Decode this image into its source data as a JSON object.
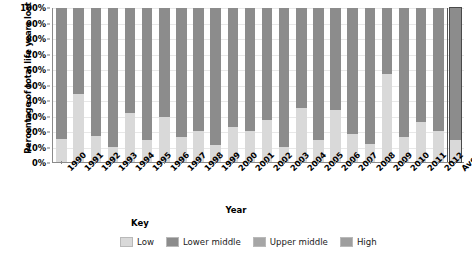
{
  "chart_data": {
    "type": "bar",
    "title": "",
    "subtitle": "",
    "xlabel": "Year",
    "ylabel": "Percentage of total life years lost",
    "stacked": true,
    "normalized_100_percent": true,
    "grid": true,
    "legend_position": "bottom",
    "legend_title": "Key",
    "ylim": [
      0,
      100
    ],
    "yticks": [
      "0%",
      "10%",
      "20%",
      "30%",
      "40%",
      "50%",
      "60%",
      "70%",
      "80%",
      "90%",
      "100%"
    ],
    "ytick_values": [
      0,
      10,
      20,
      30,
      40,
      50,
      60,
      70,
      80,
      90,
      100
    ],
    "categories": [
      "1990",
      "1991",
      "1992",
      "1993",
      "1994",
      "1995",
      "1996",
      "1997",
      "1998",
      "1999",
      "2000",
      "2001",
      "2002",
      "2003",
      "2004",
      "2005",
      "2006",
      "2007",
      "2008",
      "2009",
      "2010",
      "2011",
      "2012",
      "Average"
    ],
    "series": [
      {
        "name": "Low",
        "color": "#d9d9d9",
        "values": [
          15,
          44,
          17,
          10,
          32,
          14,
          29,
          16,
          20,
          11,
          23,
          20,
          27,
          10,
          35,
          14,
          34,
          18,
          12,
          57,
          16,
          26,
          20,
          14
        ]
      },
      {
        "name": "Lower middle",
        "color": "#8c8c8c",
        "values": [
          85,
          56,
          83,
          90,
          68,
          86,
          71,
          84,
          80,
          89,
          77,
          80,
          73,
          90,
          65,
          86,
          66,
          82,
          88,
          43,
          84,
          74,
          80,
          86
        ]
      },
      {
        "name": "Upper middle",
        "color": "#a6a6a6",
        "values": [
          0,
          0,
          0,
          0,
          0,
          0,
          0,
          0,
          0,
          0,
          0,
          0,
          0,
          0,
          0,
          0,
          0,
          0,
          0,
          0,
          0,
          0,
          0,
          0
        ]
      },
      {
        "name": "High",
        "color": "#999999",
        "values": [
          0,
          0,
          0,
          0,
          0,
          0,
          0,
          0,
          0,
          0,
          0,
          0,
          0,
          0,
          0,
          0,
          0,
          0,
          0,
          0,
          0,
          0,
          0,
          0
        ]
      }
    ],
    "average_bar_label": "Average",
    "average_bar_highlighted": true
  },
  "legend": {
    "title": "Key",
    "items": [
      {
        "label": "Low",
        "color": "#d9d9d9"
      },
      {
        "label": "Lower middle",
        "color": "#8c8c8c"
      },
      {
        "label": "Upper middle",
        "color": "#a6a6a6"
      },
      {
        "label": "High",
        "color": "#9e9e9e"
      }
    ]
  },
  "axes": {
    "x_title": "Year",
    "y_title": "Percentage of total life years lost"
  },
  "caption": ""
}
